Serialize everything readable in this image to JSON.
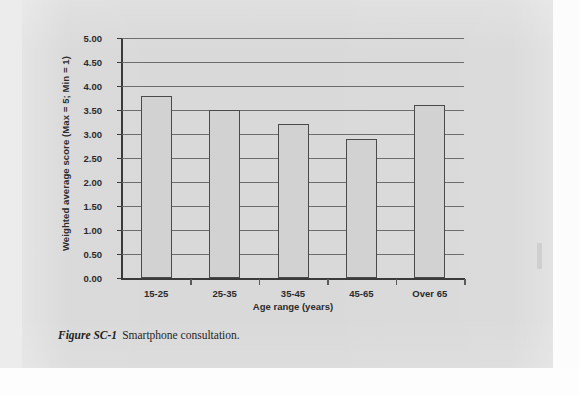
{
  "figure": {
    "caption_label": "Figure SC-1",
    "caption_text": "Smartphone consultation."
  },
  "chart_data": {
    "type": "bar",
    "title": "",
    "xlabel": "Age range (years)",
    "ylabel": "Weighted average score (Max = 5; Min = 1)",
    "categories": [
      "15-25",
      "25-35",
      "35-45",
      "45-65",
      "Over 65"
    ],
    "values": [
      3.8,
      3.5,
      3.2,
      2.9,
      3.6
    ],
    "ylim": [
      0,
      5
    ],
    "ytick_step": 0.5,
    "yticks": [
      "5.00",
      "4.50",
      "4.00",
      "3.50",
      "3.00",
      "2.50",
      "2.00",
      "1.50",
      "1.00",
      "0.50",
      "0.00"
    ],
    "ytick_values": [
      5,
      4.5,
      4,
      3.5,
      3,
      2.5,
      2,
      1.5,
      1,
      0.5,
      0
    ],
    "grid": "horizontal",
    "legend": "none",
    "bar_fill_color": "#d2d2d2",
    "bar_border_color": "#4a4a4a",
    "plot_background_color": "#d9d9d9",
    "axis_color": "#3a3a3a",
    "gridline_color": "#6e6e6e"
  }
}
